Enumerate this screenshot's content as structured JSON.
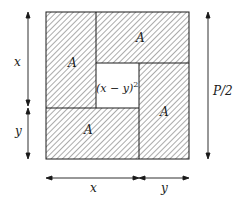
{
  "diagram": {
    "title": "",
    "colors": {
      "stroke": "#1a1a1a",
      "hatch": "#333333",
      "background": "#ffffff"
    },
    "regions": [
      {
        "id": "top-left",
        "label": "A"
      },
      {
        "id": "top-right",
        "label": "A"
      },
      {
        "id": "bottom-right",
        "label": "A"
      },
      {
        "id": "bottom-left",
        "label": "A"
      },
      {
        "id": "center",
        "label_main": "(x − y)",
        "label_sup": "2"
      }
    ],
    "dimensions": {
      "left_top": "x",
      "left_bottom": "y",
      "right": "P/2",
      "bottom_left": "x",
      "bottom_right": "y"
    }
  }
}
